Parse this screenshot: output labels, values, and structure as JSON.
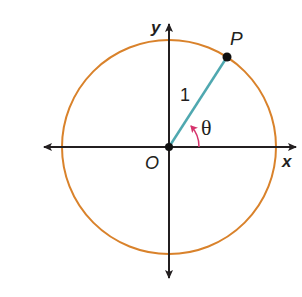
{
  "diagram": {
    "colors": {
      "circle": "#d9822b",
      "axes": "#231f20",
      "radius": "#4fa8b0",
      "angle_arc": "#d6336c",
      "points": "#111111"
    },
    "labels": {
      "y_axis": "y",
      "x_axis": "x",
      "origin": "O",
      "point": "P",
      "radius_length": "1",
      "angle": "θ"
    },
    "geometry": {
      "center": [
        169,
        147
      ],
      "radius_px": 107,
      "point_P": [
        227,
        57
      ]
    }
  }
}
